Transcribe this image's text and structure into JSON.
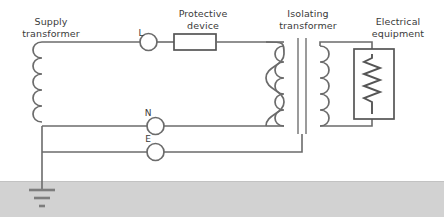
{
  "diagram": {
    "labels": {
      "supply_transformer": "Supply\ntransformer",
      "supply_transformer_line1": "Supply",
      "supply_transformer_line2": "transformer",
      "protective_device_line1": "Protective",
      "protective_device_line2": "device",
      "isolating_transformer_line1": "Isolating",
      "isolating_transformer_line2": "transformer",
      "electrical_equipment_line1": "Electrical",
      "electrical_equipment_line2": "equipment"
    },
    "terminals": [
      {
        "id": "L",
        "label": "L",
        "description": "live-terminal"
      },
      {
        "id": "N",
        "label": "N",
        "description": "neutral-terminal"
      },
      {
        "id": "E",
        "label": "E",
        "description": "earth-terminal"
      }
    ],
    "components": [
      {
        "name": "supply-transformer",
        "type": "coil"
      },
      {
        "name": "protective-device",
        "type": "rectangle-in-line"
      },
      {
        "name": "isolating-transformer",
        "type": "two-coil-with-core"
      },
      {
        "name": "electrical-equipment",
        "type": "resistor-in-box"
      },
      {
        "name": "earth-ground",
        "type": "ground-symbol"
      }
    ],
    "colors": {
      "wire": "#6b6b6b",
      "wire_dark": "#555555",
      "core": "#8a8a8a",
      "ground_band": "#d2d2d2",
      "text": "#3a3a3a",
      "background": "#ffffff"
    }
  }
}
